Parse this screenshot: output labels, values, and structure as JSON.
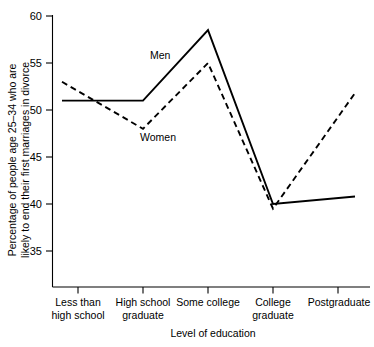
{
  "chart_data": {
    "type": "line",
    "title": "",
    "xlabel": "Level of education",
    "ylabel": "Percentage of people age 25–34 who are likely to end their first marriages in divorce",
    "categories": [
      "Less than\nhigh school",
      "High school\ngraduate",
      "Some college",
      "College\ngraduate",
      "Postgraduate"
    ],
    "category_lines": [
      [
        "Less than",
        "high school"
      ],
      [
        "High school",
        "graduate"
      ],
      [
        "Some college",
        ""
      ],
      [
        "College",
        "graduate"
      ],
      [
        "Postgraduate",
        ""
      ]
    ],
    "ylim": [
      33,
      60
    ],
    "yticks": [
      35,
      40,
      45,
      50,
      55,
      60
    ],
    "ytick_labels": [
      "35",
      "40",
      "45",
      "50",
      "55",
      "60"
    ],
    "grid": false,
    "legend_position": "inline-annotation",
    "series": [
      {
        "name": "Men",
        "style": "solid",
        "values": [
          51.0,
          51.0,
          58.5,
          40.0,
          40.8
        ],
        "label_x": 150,
        "label_y": 59
      },
      {
        "name": "Women",
        "style": "dashed",
        "values": [
          53.0,
          48.0,
          55.0,
          39.5,
          51.8
        ],
        "label_x": 140,
        "label_y": 141
      }
    ],
    "annotations": [
      "Men",
      "Women"
    ]
  },
  "axis": {
    "y_label": "Percentage of people age 25–34 who are",
    "y_label_line2": "likely to end their first marriages in divorce",
    "x_label": "Level of education",
    "tick_35": "35",
    "tick_40": "40",
    "tick_45": "45",
    "tick_50": "50",
    "tick_55": "55",
    "tick_60": "60"
  },
  "categories": {
    "c0_l1": "Less than",
    "c0_l2": "high school",
    "c1_l1": "High school",
    "c1_l2": "graduate",
    "c2_l1": "Some college",
    "c3_l1": "College",
    "c3_l2": "graduate",
    "c4_l1": "Postgraduate"
  },
  "series_labels": {
    "men": "Men",
    "women": "Women"
  },
  "colors": {
    "line": "#000000",
    "axis": "#000000",
    "background": "#ffffff"
  }
}
